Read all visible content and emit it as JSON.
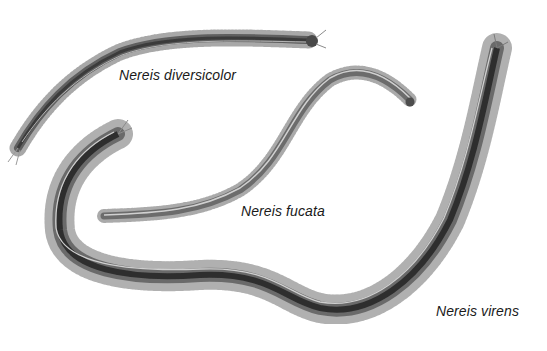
{
  "illustration": {
    "subject": "Nereis ragworm species",
    "specimens": [
      {
        "label": "Nereis diversicolor",
        "x": 119,
        "y": 67
      },
      {
        "label": "Nereis fucata",
        "x": 241,
        "y": 203
      },
      {
        "label": "Nereis virens",
        "x": 436,
        "y": 303
      }
    ],
    "colors": {
      "background": "#ffffff",
      "body_dark": "#2e2e2e",
      "body_mid": "#6a6a6a",
      "fringe": "#9a9a9a",
      "highlight": "#d8d8d8",
      "label": "#1a1a1a"
    }
  }
}
